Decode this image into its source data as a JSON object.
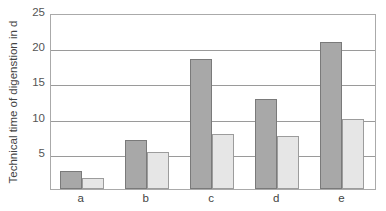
{
  "chart_data": {
    "type": "bar",
    "title": "",
    "xlabel": "",
    "ylabel": "Technical time of digenstion in d",
    "categories": [
      "a",
      "b",
      "c",
      "d",
      "e"
    ],
    "series": [
      {
        "name": "series 1",
        "color": "#a8a8a8",
        "values": [
          2.5,
          7.0,
          18.5,
          12.8,
          20.9
        ]
      },
      {
        "name": "series 2",
        "color": "#e6e6e6",
        "values": [
          1.5,
          5.2,
          7.8,
          7.5,
          10.0
        ]
      }
    ],
    "ylim": [
      0,
      25
    ],
    "yticks": [
      5,
      10,
      15,
      20,
      25
    ],
    "grid": true,
    "legend": "none"
  }
}
